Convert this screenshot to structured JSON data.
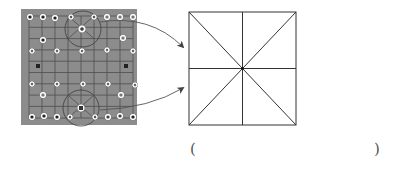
{
  "figure": {
    "board": {
      "description": "photo of a Chinese chess (xiangqi) board with pieces",
      "background_color": "#8c8c8c",
      "grid_color": "#4a4a4a",
      "columns": 9,
      "rows": 10,
      "highlight_circles": [
        "top-palace",
        "bottom-palace"
      ]
    },
    "diagram": {
      "description": "square divided by horizontal, vertical and both diagonal lines",
      "line_color": "#333333"
    },
    "arrows": [
      {
        "from": "top-palace",
        "to": "square"
      },
      {
        "from": "bottom-palace",
        "to": "square"
      }
    ],
    "answer": {
      "open_paren": "(",
      "close_paren": ")",
      "value": ""
    }
  }
}
